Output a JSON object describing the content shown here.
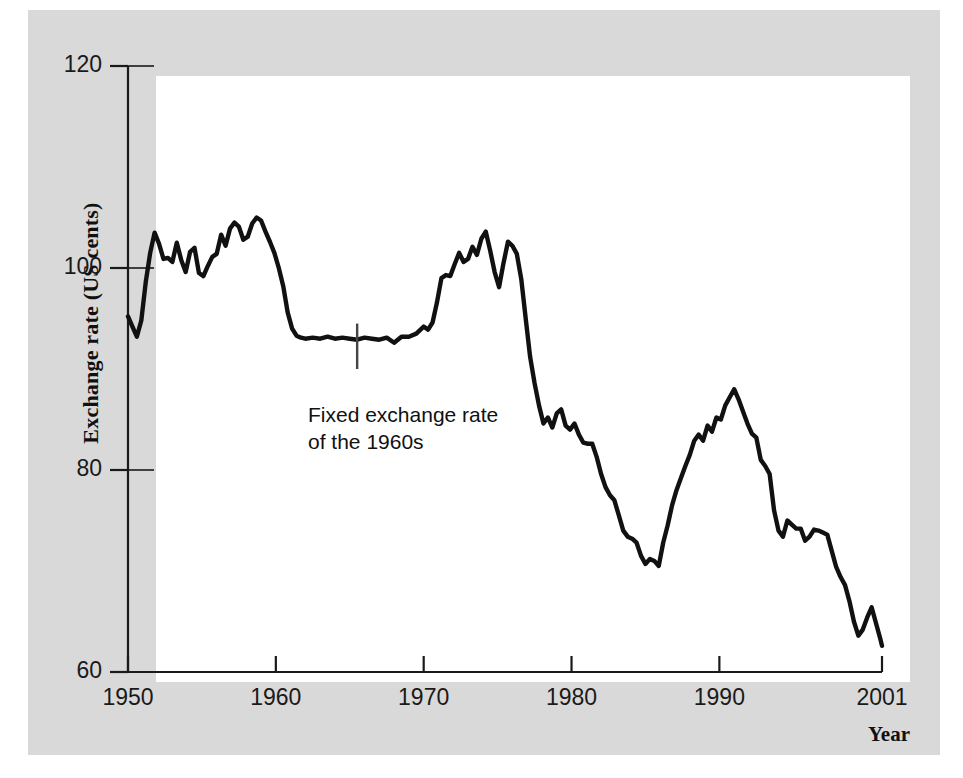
{
  "figure": {
    "background_color": "#ffffff",
    "plate_color": "#d9d9d9",
    "canvas_color": "#ffffff",
    "line_color": "#111111",
    "axis_color": "#1a1a1a"
  },
  "axes": {
    "y_title": "Exchange rate (US cents)",
    "x_title": "Year",
    "y_ticks": [
      60,
      80,
      100,
      120
    ],
    "y_tick_labels": [
      "60",
      "80",
      "100",
      "120"
    ],
    "x_ticks": [
      1950,
      1960,
      1970,
      1980,
      1990,
      2001
    ],
    "x_tick_labels": [
      "1950",
      "1960",
      "1970",
      "1980",
      "1990",
      "2001"
    ],
    "xlim": [
      1950,
      2001
    ],
    "ylim": [
      60,
      120
    ],
    "gridline_at_100": true
  },
  "annotations": [
    {
      "name": "fixed-exchange-rate-note",
      "text": "Fixed exchange rate\nof the 1960s",
      "leader_x_year": 1965.5,
      "leader_y_top": 94.5,
      "leader_y_bottom": 90.0
    }
  ],
  "chart_data": {
    "type": "line",
    "title": "",
    "xlabel": "Year",
    "ylabel": "Exchange rate (US cents)",
    "xlim": [
      1950,
      2001
    ],
    "ylim": [
      60,
      120
    ],
    "grid": false,
    "legend": "none",
    "series": [
      {
        "name": "Australian dollar exchange rate (US cents)",
        "x": [
          1950.0,
          1950.3,
          1950.6,
          1950.9,
          1951.2,
          1951.5,
          1951.8,
          1952.1,
          1952.4,
          1952.7,
          1953.0,
          1953.3,
          1953.6,
          1953.9,
          1954.2,
          1954.5,
          1954.8,
          1955.1,
          1955.4,
          1955.7,
          1956.0,
          1956.3,
          1956.6,
          1956.9,
          1957.2,
          1957.5,
          1957.8,
          1958.1,
          1958.4,
          1958.7,
          1959.0,
          1959.3,
          1959.6,
          1959.9,
          1960.2,
          1960.5,
          1960.8,
          1961.1,
          1961.4,
          1961.7,
          1962.0,
          1962.5,
          1963.0,
          1963.5,
          1964.0,
          1964.5,
          1965.0,
          1965.5,
          1966.0,
          1966.5,
          1967.0,
          1967.5,
          1968.0,
          1968.5,
          1969.0,
          1969.5,
          1970.0,
          1970.3,
          1970.6,
          1970.9,
          1971.2,
          1971.5,
          1971.8,
          1972.1,
          1972.4,
          1972.7,
          1973.0,
          1973.3,
          1973.6,
          1973.9,
          1974.2,
          1974.5,
          1974.8,
          1975.1,
          1975.4,
          1975.7,
          1976.0,
          1976.3,
          1976.6,
          1976.9,
          1977.2,
          1977.5,
          1977.8,
          1978.1,
          1978.4,
          1978.7,
          1979.0,
          1979.3,
          1979.6,
          1979.9,
          1980.2,
          1980.5,
          1980.8,
          1981.1,
          1981.4,
          1981.7,
          1982.0,
          1982.3,
          1982.6,
          1982.9,
          1983.2,
          1983.5,
          1983.8,
          1984.1,
          1984.4,
          1984.7,
          1985.0,
          1985.3,
          1985.6,
          1985.9,
          1986.2,
          1986.5,
          1986.8,
          1987.1,
          1987.4,
          1987.7,
          1988.0,
          1988.3,
          1988.6,
          1988.9,
          1989.2,
          1989.5,
          1989.8,
          1990.1,
          1990.4,
          1990.7,
          1991.0,
          1991.3,
          1991.6,
          1991.9,
          1992.2,
          1992.5,
          1992.8,
          1993.1,
          1993.4,
          1993.7,
          1994.0,
          1994.3,
          1994.6,
          1994.9,
          1995.2,
          1995.5,
          1995.8,
          1996.1,
          1996.4,
          1996.7,
          1997.0,
          1997.3,
          1997.6,
          1997.9,
          1998.2,
          1998.5,
          1998.8,
          1999.1,
          1999.4,
          1999.7,
          2000.0,
          2000.3,
          2000.6,
          2000.9,
          2001.0
        ],
        "y": [
          95.2,
          94.2,
          93.2,
          94.8,
          98.6,
          101.5,
          103.5,
          102.4,
          100.9,
          101.0,
          100.6,
          102.5,
          100.8,
          99.6,
          101.6,
          102.0,
          99.5,
          99.2,
          100.2,
          101.1,
          101.4,
          103.3,
          102.2,
          103.9,
          104.5,
          104.1,
          102.8,
          103.1,
          104.4,
          105.0,
          104.7,
          103.6,
          102.6,
          101.5,
          100.0,
          98.2,
          95.6,
          94.0,
          93.3,
          93.1,
          93.0,
          93.1,
          93.0,
          93.2,
          93.0,
          93.1,
          93.0,
          92.9,
          93.1,
          93.0,
          92.9,
          93.1,
          92.6,
          93.2,
          93.2,
          93.5,
          94.2,
          93.9,
          94.6,
          96.6,
          99.0,
          99.3,
          99.2,
          100.4,
          101.5,
          100.6,
          100.9,
          102.1,
          101.3,
          102.9,
          103.6,
          101.7,
          99.6,
          98.1,
          100.5,
          102.6,
          102.2,
          101.4,
          98.9,
          95.0,
          91.2,
          88.6,
          86.4,
          84.6,
          85.2,
          84.2,
          85.6,
          86.0,
          84.4,
          84.0,
          84.6,
          83.5,
          82.7,
          82.6,
          82.6,
          81.3,
          79.6,
          78.3,
          77.5,
          77.0,
          75.5,
          74.0,
          73.4,
          73.2,
          72.8,
          71.5,
          70.7,
          71.2,
          71.0,
          70.5,
          72.8,
          74.5,
          76.5,
          78.0,
          79.2,
          80.4,
          81.5,
          82.9,
          83.5,
          82.9,
          84.4,
          83.8,
          85.2,
          85.0,
          86.4,
          87.2,
          88.0,
          87.0,
          85.8,
          84.6,
          83.6,
          83.2,
          81.0,
          80.4,
          79.6,
          76.0,
          74.0,
          73.4,
          75.0,
          74.6,
          74.2,
          74.2,
          73.0,
          73.4,
          74.1,
          74.0,
          73.8,
          73.6,
          72.0,
          70.4,
          69.4,
          68.6,
          67.0,
          65.0,
          63.6,
          64.2,
          65.4,
          66.4,
          64.8,
          63.2,
          62.6
        ]
      }
    ]
  }
}
